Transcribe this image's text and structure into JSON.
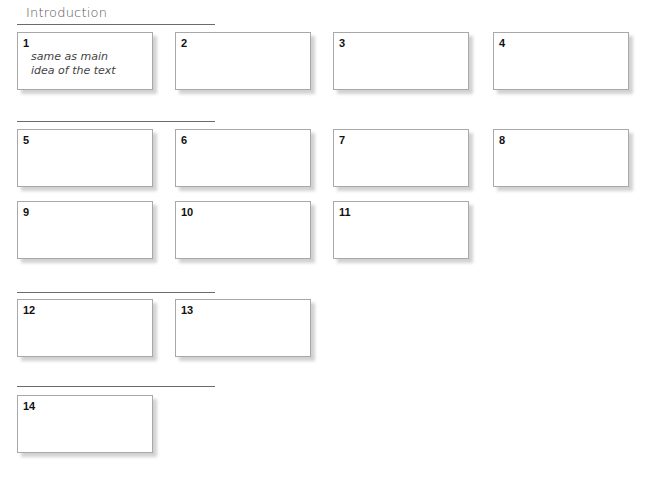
{
  "sections": [
    {
      "label": "Introduction"
    },
    {
      "label": ""
    },
    {
      "label": ""
    },
    {
      "label": ""
    }
  ],
  "cards": [
    {
      "number": "1",
      "note_line1": "same as main",
      "note_line2": "idea of the text"
    },
    {
      "number": "2"
    },
    {
      "number": "3"
    },
    {
      "number": "4"
    },
    {
      "number": "5"
    },
    {
      "number": "6"
    },
    {
      "number": "7"
    },
    {
      "number": "8"
    },
    {
      "number": "9"
    },
    {
      "number": "10"
    },
    {
      "number": "11"
    },
    {
      "number": "12"
    },
    {
      "number": "13"
    },
    {
      "number": "14"
    }
  ]
}
